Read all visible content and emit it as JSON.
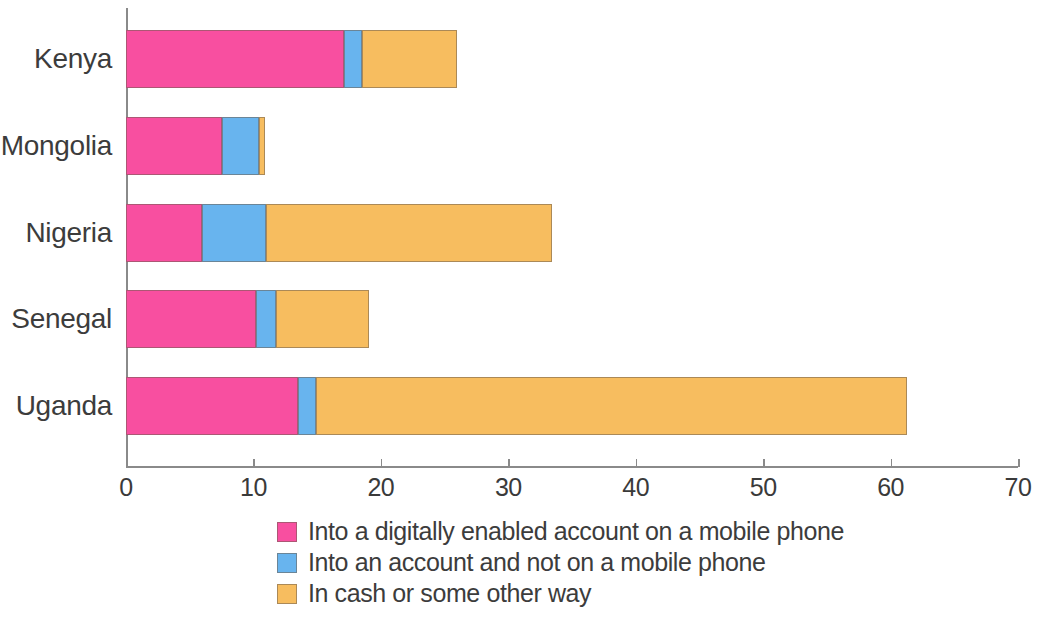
{
  "chart_data": {
    "type": "bar",
    "orientation": "horizontal",
    "stacked": true,
    "title": "",
    "subtitle": "",
    "xlabel": "",
    "ylabel": "",
    "xlim": [
      0,
      70
    ],
    "ylim": null,
    "grid": false,
    "legend_position": "bottom",
    "xticks": [
      0,
      10,
      20,
      30,
      40,
      50,
      60,
      70
    ],
    "xtick_labels": [
      "0",
      "10",
      "20",
      "30",
      "40",
      "50",
      "60",
      "70"
    ],
    "categories": [
      "Kenya",
      "Mongolia",
      "Nigeria",
      "Senegal",
      "Uganda"
    ],
    "series": [
      {
        "name": "Into a digitally enabled account on a mobile phone",
        "color": "#F84FA0",
        "values": [
          17.1,
          7.5,
          6.0,
          10.2,
          13.5
        ]
      },
      {
        "name": "Into an account and not on a mobile phone",
        "color": "#68B4EE",
        "values": [
          1.4,
          2.9,
          5.0,
          1.6,
          1.4
        ]
      },
      {
        "name": "In cash or some other way",
        "color": "#F7BD5F",
        "values": [
          7.5,
          0.5,
          22.4,
          7.3,
          46.4
        ]
      }
    ],
    "totals": [
      26.0,
      10.9,
      33.4,
      19.1,
      61.3
    ]
  },
  "colors": {
    "pink": "#F84FA0",
    "blue": "#68B4EE",
    "orange": "#F7BD5F",
    "axis": "#8a8a8a",
    "text": "#3c3c3c",
    "background": "#ffffff"
  }
}
